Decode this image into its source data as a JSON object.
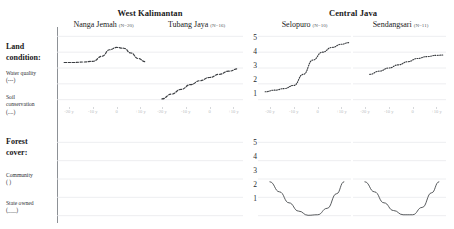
{
  "figure": {
    "regions": [
      {
        "name": "West Kalimantan"
      },
      {
        "name": "Central Java"
      }
    ],
    "columns": [
      {
        "village": "Nanga Jemah",
        "n_label": "(N=20)",
        "region": "West Kalimantan"
      },
      {
        "village": "Tubang Jaya",
        "n_label": "(N=16)",
        "region": "West Kalimantan"
      },
      {
        "village": "Selopuro",
        "n_label": "(N=10)",
        "region": "Central Java"
      },
      {
        "village": "Sendangsari",
        "n_label": "(N=11)",
        "region": "Central Java"
      }
    ],
    "row_blocks": [
      {
        "title": "Land condition:",
        "series_labels": [
          "Water quality\n(---)",
          "Soil\nconservation\n(....)"
        ]
      },
      {
        "title": "Forest\ncover:",
        "series_labels": [
          "Community\n(     )",
          "State owned\n(___)"
        ]
      }
    ]
  },
  "chart_data": {
    "type": "line",
    "xlabel": "",
    "ylabel": "",
    "xticklabels": [
      "-20 y",
      "-10 y",
      "0",
      "+10 y"
    ],
    "xtickvalues": [
      -20,
      -10,
      0,
      10
    ],
    "xlim": [
      -25,
      14
    ],
    "yticklabels": [
      "5",
      "4",
      "3",
      "2",
      "1"
    ],
    "ylim": [
      0.6,
      5.4
    ],
    "grid": true,
    "legend": "none",
    "panels": [
      {
        "row": "Land condition:",
        "column": "Nanga Jemah",
        "region": "West Kalimantan",
        "series": [
          {
            "name": "Water quality",
            "style": "dashed",
            "x": [
              -22,
              -18,
              -14,
              -10,
              -6,
              -3,
              0,
              3,
              6,
              9,
              12
            ],
            "values": [
              3.35,
              3.35,
              3.38,
              3.42,
              3.75,
              4.15,
              4.3,
              4.25,
              3.95,
              3.6,
              3.4
            ]
          }
        ]
      },
      {
        "row": "Land condition:",
        "column": "Tubang Jaya",
        "region": "West Kalimantan",
        "series": [
          {
            "name": "Water quality",
            "style": "dashed",
            "x": [
              -20,
              -16,
              -12,
              -8,
              -4,
              0,
              4,
              8,
              12
            ],
            "values": [
              1.05,
              1.35,
              1.65,
              1.95,
              2.2,
              2.4,
              2.6,
              2.8,
              2.95
            ]
          }
        ]
      },
      {
        "row": "Land condition:",
        "column": "Selopuro",
        "region": "Central Java",
        "series": [
          {
            "name": "Soil conservation",
            "style": "dotted",
            "x": [
              -22,
              -18,
              -14,
              -10,
              -6,
              -2,
              2,
              6,
              10,
              13
            ],
            "values": [
              1.5,
              1.6,
              1.7,
              1.9,
              2.6,
              3.5,
              4.0,
              4.3,
              4.5,
              4.6
            ]
          }
        ]
      },
      {
        "row": "Land condition:",
        "column": "Sendangsari",
        "region": "Central Java",
        "series": [
          {
            "name": "Soil conservation",
            "style": "dotted",
            "x": [
              -18,
              -14,
              -10,
              -6,
              -2,
              2,
              6,
              10,
              13
            ],
            "values": [
              2.6,
              2.8,
              3.0,
              3.2,
              3.4,
              3.6,
              3.72,
              3.8,
              3.82
            ]
          }
        ]
      },
      {
        "row": "Forest cover:",
        "column": "Nanga Jemah",
        "region": "West Kalimantan",
        "series": []
      },
      {
        "row": "Forest cover:",
        "column": "Tubang Jaya",
        "region": "West Kalimantan",
        "series": []
      },
      {
        "row": "Forest cover:",
        "column": "Selopuro",
        "region": "Central Java",
        "series": [
          {
            "name": "State owned",
            "style": "solid",
            "x": [
              -20,
              -16,
              -12,
              -8,
              -4,
              0,
              4,
              8,
              11
            ],
            "values": [
              2.85,
              2.3,
              1.7,
              1.25,
              1.02,
              1.05,
              1.4,
              2.2,
              2.85
            ]
          }
        ]
      },
      {
        "row": "Forest cover:",
        "column": "Sendangsari",
        "region": "Central Java",
        "series": [
          {
            "name": "State owned",
            "style": "solid",
            "x": [
              -20,
              -16,
              -12,
              -8,
              -4,
              0,
              4,
              8,
              11
            ],
            "values": [
              2.85,
              2.3,
              1.7,
              1.28,
              1.05,
              1.05,
              1.45,
              2.25,
              2.85
            ]
          }
        ]
      }
    ]
  },
  "style": {
    "grid_color": "#e9eaec",
    "line_color": "#3b3e42",
    "axis_text": "#25282c",
    "xtick_text": "#b9bcc0"
  }
}
